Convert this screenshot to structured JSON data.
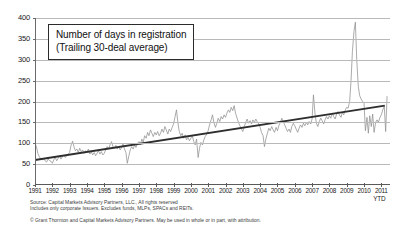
{
  "figure": {
    "title_lines": [
      "Number of days in registration",
      "(Trailing 30-deal average)"
    ],
    "source_lines": [
      "Source: Capital Markets Advisory Partners, LLC., All rights reserved",
      "Includes only corporate Issuers. Excludes funds, MLPs, SPACs and REITs."
    ],
    "copyright": "© Grant Thornton and Capital Markets Advisory Partners. May be used in whole or in part, with attribution.",
    "ytd_note": "YTD",
    "colors": {
      "series": "#8f8f8f",
      "trend": "#2e2e2e",
      "grid": "#b9b9b9",
      "axis": "#5a5a5a",
      "text": "#202020",
      "background": "#ffffff"
    }
  },
  "chart_data": {
    "type": "line",
    "title": "Number of days in registration (Trailing 30-deal average)",
    "xlabel": "",
    "ylabel": "",
    "ylim": [
      0,
      400
    ],
    "xlim": [
      1991,
      2011.5
    ],
    "grid": true,
    "legend": false,
    "ytick_labels": [
      "0",
      "50",
      "100",
      "150",
      "200",
      "250",
      "300",
      "350",
      "400"
    ],
    "yticks": [
      0,
      50,
      100,
      150,
      200,
      250,
      300,
      350,
      400
    ],
    "xtick_labels": [
      "1991",
      "1992",
      "1993",
      "1994",
      "1995",
      "1996",
      "1997",
      "1998",
      "1999",
      "2000",
      "2001",
      "2002",
      "2003",
      "2004",
      "2005",
      "2006",
      "2007",
      "2008",
      "2009",
      "2010",
      "2011"
    ],
    "xticks": [
      1991,
      1992,
      1993,
      1994,
      1995,
      1996,
      1997,
      1998,
      1999,
      2000,
      2001,
      2002,
      2003,
      2004,
      2005,
      2006,
      2007,
      2008,
      2009,
      2010,
      2011
    ],
    "annotations": [
      "YTD"
    ],
    "series": [
      {
        "name": "Number of days in registration (trailing 30-deal average)",
        "color": "#8f8f8f",
        "x": [
          1991.0,
          1991.08,
          1991.17,
          1991.25,
          1991.33,
          1991.42,
          1991.5,
          1991.58,
          1991.67,
          1991.75,
          1991.83,
          1991.92,
          1992.0,
          1992.08,
          1992.17,
          1992.25,
          1992.33,
          1992.42,
          1992.5,
          1992.58,
          1992.67,
          1992.75,
          1992.83,
          1992.92,
          1993.0,
          1993.08,
          1993.17,
          1993.25,
          1993.33,
          1993.42,
          1993.5,
          1993.58,
          1993.67,
          1993.75,
          1993.83,
          1993.92,
          1994.0,
          1994.08,
          1994.17,
          1994.25,
          1994.33,
          1994.42,
          1994.5,
          1994.58,
          1994.67,
          1994.75,
          1994.83,
          1994.92,
          1995.0,
          1995.08,
          1995.17,
          1995.25,
          1995.33,
          1995.42,
          1995.5,
          1995.58,
          1995.67,
          1995.75,
          1995.83,
          1995.92,
          1996.0,
          1996.08,
          1996.17,
          1996.25,
          1996.33,
          1996.42,
          1996.5,
          1996.58,
          1996.67,
          1996.75,
          1996.83,
          1996.92,
          1997.0,
          1997.08,
          1997.17,
          1997.25,
          1997.33,
          1997.42,
          1997.5,
          1997.58,
          1997.67,
          1997.75,
          1997.83,
          1997.92,
          1998.0,
          1998.08,
          1998.17,
          1998.25,
          1998.33,
          1998.42,
          1998.5,
          1998.58,
          1998.67,
          1998.75,
          1998.83,
          1998.92,
          1999.0,
          1999.08,
          1999.17,
          1999.25,
          1999.33,
          1999.42,
          1999.5,
          1999.58,
          1999.67,
          1999.75,
          1999.83,
          1999.92,
          2000.0,
          2000.08,
          2000.17,
          2000.25,
          2000.33,
          2000.42,
          2000.5,
          2000.58,
          2000.67,
          2000.75,
          2000.83,
          2000.92,
          2001.0,
          2001.08,
          2001.17,
          2001.25,
          2001.33,
          2001.42,
          2001.5,
          2001.58,
          2001.67,
          2001.75,
          2001.83,
          2001.92,
          2002.0,
          2002.08,
          2002.17,
          2002.25,
          2002.33,
          2002.42,
          2002.5,
          2002.58,
          2002.67,
          2002.75,
          2002.83,
          2002.92,
          2003.0,
          2003.08,
          2003.17,
          2003.25,
          2003.33,
          2003.42,
          2003.5,
          2003.58,
          2003.67,
          2003.75,
          2003.83,
          2003.92,
          2004.0,
          2004.08,
          2004.17,
          2004.25,
          2004.33,
          2004.42,
          2004.5,
          2004.58,
          2004.67,
          2004.75,
          2004.83,
          2004.92,
          2005.0,
          2005.08,
          2005.17,
          2005.25,
          2005.33,
          2005.42,
          2005.5,
          2005.58,
          2005.67,
          2005.75,
          2005.83,
          2005.92,
          2006.0,
          2006.08,
          2006.17,
          2006.25,
          2006.33,
          2006.42,
          2006.5,
          2006.58,
          2006.67,
          2006.75,
          2006.83,
          2006.92,
          2007.0,
          2007.08,
          2007.17,
          2007.25,
          2007.33,
          2007.42,
          2007.5,
          2007.58,
          2007.67,
          2007.75,
          2007.83,
          2007.92,
          2008.0,
          2008.08,
          2008.17,
          2008.25,
          2008.33,
          2008.42,
          2008.5,
          2008.58,
          2008.67,
          2008.75,
          2008.83,
          2008.92,
          2009.0,
          2009.08,
          2009.17,
          2009.25,
          2009.33,
          2009.42,
          2009.5,
          2009.58,
          2009.67,
          2009.75,
          2009.83,
          2009.92,
          2010.0,
          2010.08,
          2010.17,
          2010.25,
          2010.33,
          2010.42,
          2010.5,
          2010.58,
          2010.67,
          2010.75,
          2010.83,
          2010.92,
          2011.0,
          2011.08,
          2011.17,
          2011.25,
          2011.33
        ],
        "y": [
          100,
          92,
          75,
          68,
          62,
          60,
          64,
          58,
          55,
          62,
          59,
          57,
          52,
          60,
          66,
          58,
          63,
          70,
          62,
          68,
          72,
          66,
          70,
          74,
          78,
          95,
          105,
          92,
          82,
          86,
          78,
          88,
          80,
          84,
          76,
          82,
          79,
          86,
          74,
          80,
          72,
          78,
          70,
          76,
          82,
          74,
          80,
          72,
          76,
          84,
          92,
          86,
          96,
          104,
          92,
          88,
          95,
          86,
          92,
          84,
          90,
          98,
          86,
          78,
          52,
          70,
          84,
          92,
          86,
          96,
          90,
          100,
          104,
          96,
          110,
          102,
          118,
          112,
          126,
          118,
          132,
          124,
          116,
          126,
          120,
          128,
          118,
          124,
          134,
          126,
          140,
          132,
          122,
          134,
          128,
          138,
          146,
          162,
          180,
          150,
          128,
          118,
          124,
          112,
          120,
          108,
          114,
          106,
          112,
          118,
          104,
          96,
          110,
          66,
          88,
          102,
          96,
          108,
          116,
          122,
          130,
          144,
          156,
          168,
          150,
          138,
          148,
          160,
          152,
          164,
          158,
          168,
          162,
          172,
          180,
          174,
          186,
          178,
          190,
          172,
          160,
          150,
          142,
          134,
          128,
          140,
          150,
          158,
          148,
          154,
          146,
          156,
          150,
          158,
          152,
          146,
          138,
          126,
          118,
          92,
          110,
          124,
          136,
          130,
          140,
          132,
          126,
          138,
          130,
          142,
          150,
          160,
          152,
          144,
          136,
          128,
          134,
          126,
          140,
          148,
          142,
          134,
          126,
          136,
          144,
          138,
          148,
          142,
          150,
          144,
          152,
          146,
          158,
          216,
          170,
          148,
          140,
          152,
          160,
          154,
          146,
          156,
          164,
          158,
          166,
          160,
          172,
          164,
          158,
          170,
          176,
          168,
          162,
          174,
          168,
          180,
          186,
          184,
          200,
          250,
          320,
          368,
          390,
          300,
          236,
          214,
          206,
          200,
          196,
          130,
          162,
          124,
          166,
          140,
          170,
          126,
          150,
          156,
          150,
          162,
          168,
          180,
          188,
          128,
          212
        ],
        "notes": "Monthly trailing 30-deal average; peak ~390 days in mid-2009, sharp drop in 2010."
      },
      {
        "name": "Linear trend",
        "color": "#2e2e2e",
        "type": "trendline",
        "x": [
          1991.0,
          2011.2
        ],
        "y": [
          60,
          190
        ],
        "notes": "Upward linear trend from roughly 60 days in 1991 to roughly 190 days in 2011."
      }
    ]
  }
}
